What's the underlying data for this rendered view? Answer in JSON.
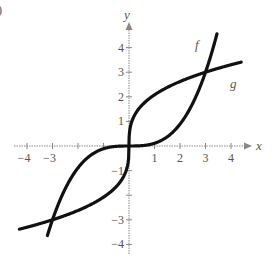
{
  "chart_data": {
    "type": "line",
    "title": "",
    "xlabel": "x",
    "ylabel": "y",
    "xlim": [
      -4.5,
      4.7
    ],
    "ylim": [
      -4.5,
      4.6
    ],
    "x_ticks": [
      -4,
      -3,
      -2,
      -1,
      1,
      2,
      3,
      4
    ],
    "x_tick_labels": [
      "-4",
      "-3",
      "",
      "",
      "1",
      "2",
      "3",
      "4"
    ],
    "y_ticks": [
      -4,
      -3,
      -2,
      -1,
      1,
      2,
      3,
      4
    ],
    "y_tick_labels": [
      "-4",
      "-3",
      "",
      "-1",
      "1",
      "2",
      "3",
      "4"
    ],
    "grid": false,
    "series": [
      {
        "name": "f",
        "formula": "x^3/9",
        "x": [
          -3.2,
          -3,
          -2,
          -1,
          0,
          1,
          2,
          3,
          3.45
        ],
        "y": [
          -3.64,
          -3,
          -0.89,
          -0.11,
          0,
          0.11,
          0.89,
          3,
          4.56
        ]
      },
      {
        "name": "g",
        "formula": "cbrt(9x)",
        "x": [
          -4.3,
          -3,
          -2,
          -1,
          0,
          1,
          2,
          3,
          4.4
        ],
        "y": [
          -3.38,
          -3,
          -2.62,
          -2.08,
          0,
          2.08,
          2.62,
          3,
          3.41
        ]
      }
    ],
    "intersections": [
      [
        -3,
        -3
      ],
      [
        0,
        0
      ],
      [
        3,
        3
      ]
    ],
    "annotations": [
      "f",
      "g"
    ]
  },
  "labels": {
    "x_axis": "x",
    "y_axis": "y",
    "f": "f",
    "g": "g",
    "corner": ")"
  }
}
